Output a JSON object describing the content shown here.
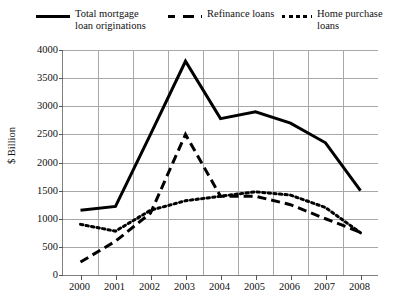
{
  "chart": {
    "ylabel": "$ Billion",
    "xlabel": "",
    "title": ""
  },
  "legend": {
    "entries": [
      {
        "label": "Total mortgage\nloan originations",
        "style": "solid",
        "swatch_name": "legend-swatch-solid"
      },
      {
        "label": "Refinance loans",
        "style": "dashed",
        "swatch_name": "legend-swatch-dashed"
      },
      {
        "label": "Home purchase\nloans",
        "style": "dotted",
        "swatch_name": "legend-swatch-dotted"
      }
    ]
  },
  "axes": {
    "y_ticks": [
      "4000",
      "3500",
      "3000",
      "2500",
      "2000",
      "1500",
      "1000",
      "500",
      "0"
    ],
    "x_ticks": [
      "2000",
      "2001",
      "2002",
      "2003",
      "2004",
      "2005",
      "2006",
      "2007",
      "2008"
    ]
  },
  "chart_data": {
    "type": "line",
    "title": "",
    "xlabel": "",
    "ylabel": "$ Billion",
    "ylim": [
      0,
      4000
    ],
    "grid": true,
    "legend_position": "top",
    "categories": [
      "2000",
      "2001",
      "2002",
      "2003",
      "2004",
      "2005",
      "2006",
      "2007",
      "2008"
    ],
    "series": [
      {
        "name": "Total mortgage loan originations",
        "style": "solid",
        "values": [
          1150,
          1220,
          2500,
          3800,
          2780,
          2900,
          2700,
          2350,
          1500
        ]
      },
      {
        "name": "Refinance loans",
        "style": "dashed",
        "values": [
          230,
          600,
          1100,
          2500,
          1400,
          1400,
          1250,
          1000,
          760
        ]
      },
      {
        "name": "Home purchase loans",
        "style": "dotted",
        "values": [
          900,
          780,
          1150,
          1320,
          1400,
          1480,
          1420,
          1200,
          750
        ]
      }
    ]
  }
}
